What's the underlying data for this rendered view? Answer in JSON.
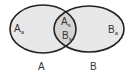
{
  "diagram": {
    "type": "venn",
    "sets": [
      {
        "name": "A",
        "label": "A",
        "region_label": {
          "base": "A",
          "sub": "a"
        }
      },
      {
        "name": "B",
        "label": "B",
        "region_label": {
          "base": "B",
          "sub": "a"
        }
      }
    ],
    "intersection": {
      "labels": [
        {
          "base": "A",
          "sub": "s"
        },
        {
          "base": "B",
          "sub": "s"
        }
      ]
    },
    "colors": {
      "fill": "#e8e8e8",
      "intersection_fill": "#d4d4d4",
      "stroke": "#222222"
    }
  }
}
